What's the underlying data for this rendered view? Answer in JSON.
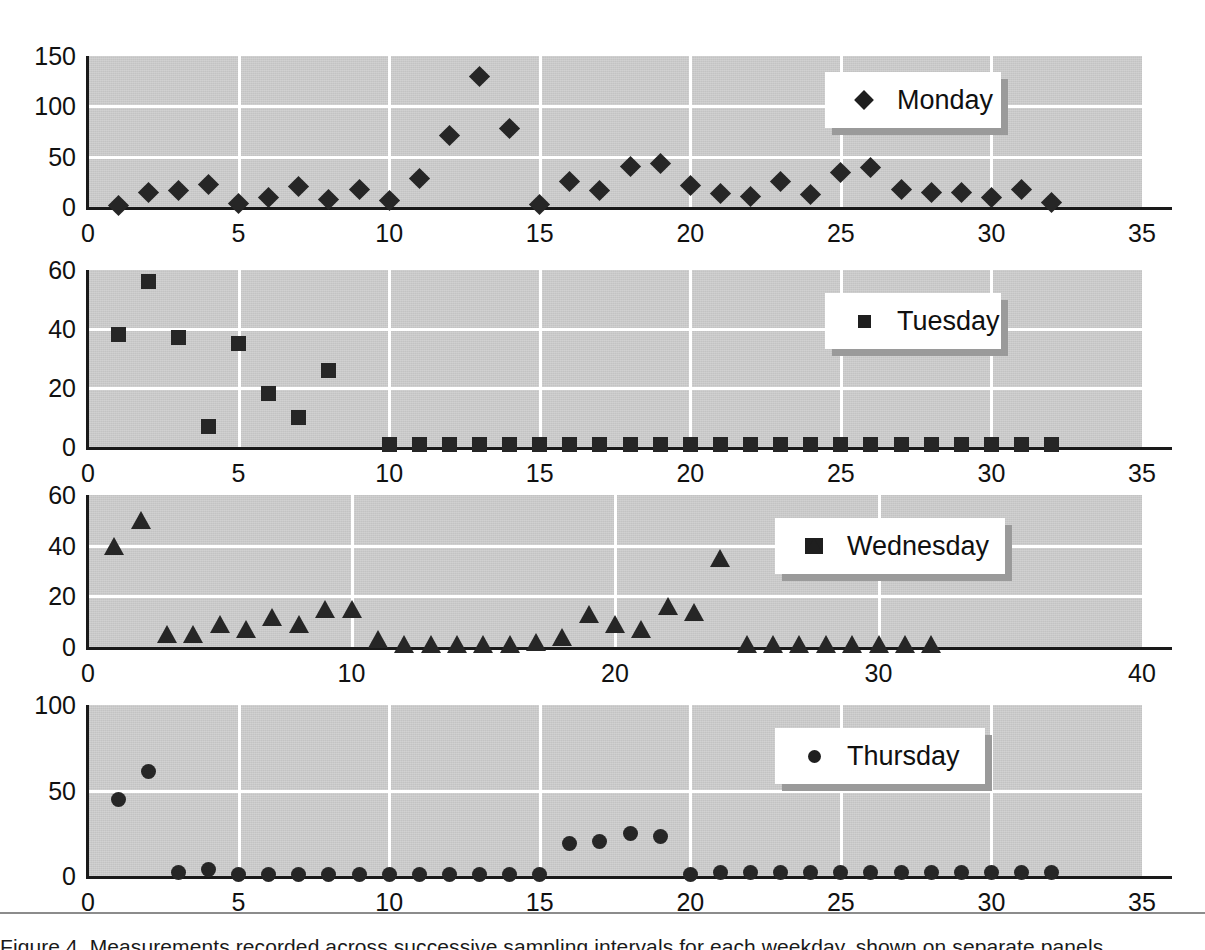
{
  "figure": {
    "background_color": "#ffffff",
    "plot_background_color": "#c3c3c3",
    "gridline_color": "#ffffff",
    "marker_color": "#262626",
    "axis_color": "#1a1a1a",
    "legend_shadow_color": "#9a9a9a",
    "caption_text": "Figure 4. Measurements recorded across successive sampling intervals for each weekday, shown on separate panels."
  },
  "chart_data": [
    {
      "type": "scatter",
      "title": "Monday",
      "legend": "Monday",
      "legend_position": "top-right inside",
      "marker": "diamond",
      "xlabel": "",
      "ylabel": "",
      "xlim": [
        0,
        35
      ],
      "ylim": [
        0,
        150
      ],
      "xticks": [
        0,
        5,
        10,
        15,
        20,
        25,
        30,
        35
      ],
      "yticks": [
        0,
        50,
        100,
        150
      ],
      "grid": true,
      "x": [
        1,
        2,
        3,
        4,
        5,
        6,
        7,
        8,
        9,
        10,
        11,
        12,
        13,
        14,
        15,
        16,
        17,
        18,
        19,
        20,
        21,
        22,
        23,
        24,
        25,
        26,
        27,
        28,
        29,
        30,
        31,
        32
      ],
      "values": [
        1,
        14,
        16,
        22,
        3,
        9,
        20,
        7,
        17,
        6,
        28,
        71,
        130,
        78,
        2,
        25,
        16,
        40,
        43,
        21,
        13,
        10,
        25,
        12,
        34,
        39,
        17,
        14,
        14,
        9,
        17,
        4
      ]
    },
    {
      "type": "scatter",
      "title": "Tuesday",
      "legend": "Tuesday",
      "legend_position": "top-right inside",
      "marker": "square",
      "xlabel": "",
      "ylabel": "",
      "xlim": [
        0,
        35
      ],
      "ylim": [
        0,
        60
      ],
      "xticks": [
        0,
        5,
        10,
        15,
        20,
        25,
        30,
        35
      ],
      "yticks": [
        0,
        20,
        40,
        60
      ],
      "grid": true,
      "x": [
        1,
        2,
        3,
        4,
        5,
        6,
        7,
        8,
        10,
        11,
        12,
        13,
        14,
        15,
        16,
        17,
        18,
        19,
        20,
        21,
        22,
        23,
        24,
        25,
        26,
        27,
        28,
        29,
        30,
        31,
        32
      ],
      "values": [
        38,
        56,
        37,
        7,
        35,
        18,
        10,
        26,
        1,
        1,
        1,
        1,
        1,
        1,
        1,
        1,
        1,
        1,
        1,
        1,
        1,
        1,
        1,
        1,
        1,
        1,
        1,
        1,
        1,
        1,
        1
      ]
    },
    {
      "type": "scatter",
      "title": "Wednesday",
      "legend": "Wednesday",
      "legend_position": "top-right inside",
      "marker": "triangle",
      "xlabel": "",
      "ylabel": "",
      "xlim": [
        0,
        40
      ],
      "ylim": [
        0,
        60
      ],
      "xticks": [
        0,
        10,
        20,
        30,
        40
      ],
      "yticks": [
        0,
        20,
        40,
        60
      ],
      "grid": true,
      "x": [
        1,
        2,
        3,
        4,
        5,
        6,
        7,
        8,
        9,
        10,
        11,
        12,
        13,
        14,
        15,
        16,
        17,
        18,
        19,
        20,
        21,
        22,
        23,
        24,
        25,
        26,
        27,
        28,
        29,
        30,
        31,
        32
      ],
      "values": [
        40,
        50,
        5,
        5,
        9,
        7,
        12,
        9,
        15,
        15,
        3,
        1,
        1,
        1,
        1,
        1,
        2,
        4,
        13,
        9,
        7,
        16,
        14,
        35,
        1,
        1,
        1,
        1,
        1,
        1,
        1,
        1
      ]
    },
    {
      "type": "scatter",
      "title": "Thursday",
      "legend": "Thursday",
      "legend_position": "top-right inside",
      "marker": "circle",
      "xlabel": "",
      "ylabel": "",
      "xlim": [
        0,
        35
      ],
      "ylim": [
        0,
        100
      ],
      "xticks": [
        0,
        5,
        10,
        15,
        20,
        25,
        30,
        35
      ],
      "yticks": [
        0,
        50,
        100
      ],
      "grid": true,
      "x": [
        1,
        2,
        3,
        4,
        5,
        6,
        7,
        8,
        9,
        10,
        11,
        12,
        13,
        14,
        15,
        16,
        17,
        18,
        19,
        20,
        21,
        22,
        23,
        24,
        25,
        26,
        27,
        28,
        29,
        30,
        31,
        32
      ],
      "values": [
        45,
        61,
        2,
        4,
        1,
        1,
        1,
        1,
        1,
        1,
        1,
        1,
        1,
        1,
        1,
        19,
        20,
        25,
        23,
        1,
        2,
        2,
        2,
        2,
        2,
        2,
        2,
        2,
        2,
        2,
        2,
        2
      ]
    }
  ]
}
